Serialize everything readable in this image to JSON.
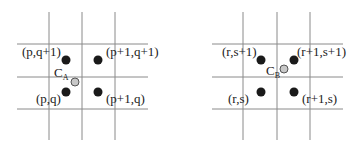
{
  "diagram": {
    "panels": [
      {
        "id": "A",
        "center_label": "C",
        "center_subscript": "A",
        "grid": {
          "vlines_x": [
            49,
            82,
            115
          ],
          "hlines_y": [
            44,
            77,
            109
          ],
          "x_range": [
            17,
            148
          ],
          "y_range": [
            12,
            140
          ]
        },
        "points": [
          {
            "label": "(p,q+1)",
            "x": 66,
            "y": 60,
            "label_x": 22,
            "label_y": 56
          },
          {
            "label": "(p+1,q+1)",
            "x": 98,
            "y": 60,
            "label_x": 106,
            "label_y": 56
          },
          {
            "label": "(p,q)",
            "x": 66,
            "y": 92,
            "label_x": 36,
            "label_y": 103
          },
          {
            "label": "(p+1,q)",
            "x": 98,
            "y": 92,
            "label_x": 106,
            "label_y": 103
          }
        ],
        "center": {
          "x": 75,
          "y": 82,
          "label_x": 54,
          "label_y": 77
        }
      },
      {
        "id": "B",
        "center_label": "C",
        "center_subscript": "B",
        "grid": {
          "vlines_x": [
            243,
            277,
            310
          ],
          "hlines_y": [
            44,
            77,
            109
          ],
          "x_range": [
            212,
            343
          ],
          "y_range": [
            12,
            140
          ]
        },
        "points": [
          {
            "label": "(r,s+1)",
            "x": 261,
            "y": 60,
            "label_x": 222,
            "label_y": 56
          },
          {
            "label": "(r+1,s+1)",
            "x": 294,
            "y": 60,
            "label_x": 297,
            "label_y": 56
          },
          {
            "label": "(r,s)",
            "x": 261,
            "y": 92,
            "label_x": 228,
            "label_y": 103
          },
          {
            "label": "(r+1,s)",
            "x": 294,
            "y": 92,
            "label_x": 302,
            "label_y": 103
          }
        ],
        "center": {
          "x": 284,
          "y": 69,
          "label_x": 266,
          "label_y": 75
        }
      }
    ],
    "colors": {
      "grid": "#8a8a8a",
      "point": "#1a1a1a",
      "center_fill": "#c8c8c8",
      "center_stroke": "#555555",
      "text": "#222222"
    }
  }
}
